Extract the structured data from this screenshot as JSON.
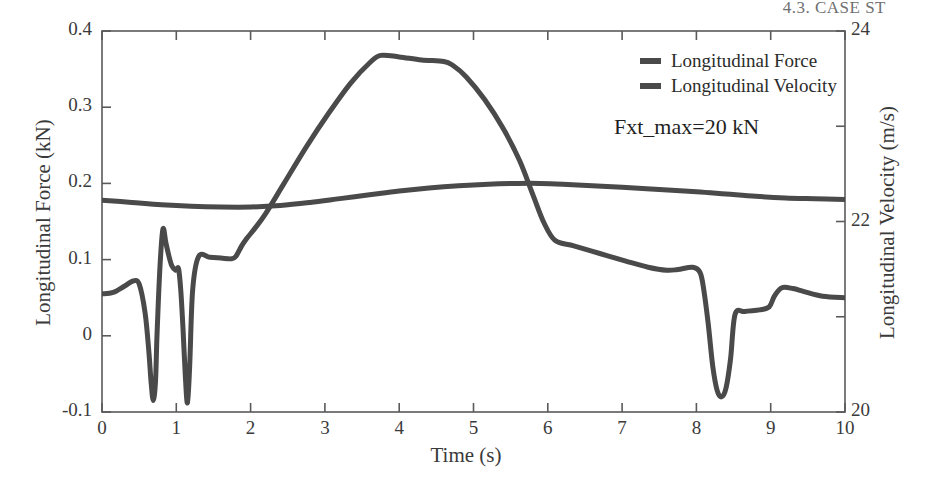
{
  "page": {
    "header": "4.3. CASE ST"
  },
  "chart_data": {
    "type": "line",
    "title": "",
    "xlabel": "Time (s)",
    "ylabel": "Longitudinal Force (kN)",
    "ylabel_right": "Longitudinal Velocity (m/s)",
    "xlim": [
      0,
      10
    ],
    "ylim": [
      -0.1,
      0.4
    ],
    "ylim_right": [
      20,
      24
    ],
    "grid": false,
    "frame": true,
    "legend_position": "top-right-inside",
    "annotations": [
      {
        "text": "Fxt_max=20 kN",
        "x": 6.2,
        "y": 0.245
      }
    ],
    "xticks": [
      0,
      1,
      2,
      3,
      4,
      5,
      6,
      7,
      8,
      9,
      10
    ],
    "xtick_labels": [
      "0",
      "1",
      "2",
      "3",
      "4",
      "5",
      "6",
      "7",
      "8",
      "9",
      "10"
    ],
    "yticks": [
      -0.1,
      0,
      0.1,
      0.2,
      0.3,
      0.4
    ],
    "ytick_labels": [
      "-0.1",
      "0",
      "0.1",
      "0.2",
      "0.3",
      "0.4"
    ],
    "yticks_right": [
      20,
      21,
      22,
      23,
      24
    ],
    "ytick_labels_right": [
      "20",
      "",
      "22",
      "",
      "24"
    ],
    "line_color": "#4a4a4a",
    "line_width": 5,
    "series": [
      {
        "name": "Longitudinal Force",
        "axis": "left",
        "units": "kN",
        "x": [
          0.0,
          0.15,
          0.3,
          0.42,
          0.5,
          0.58,
          0.63,
          0.66,
          0.69,
          0.72,
          0.74,
          0.78,
          0.82,
          0.86,
          0.9,
          0.94,
          0.99,
          1.03,
          1.06,
          1.09,
          1.12,
          1.15,
          1.18,
          1.22,
          1.3,
          1.45,
          1.6,
          1.74,
          1.8,
          1.88,
          1.95,
          2.05,
          2.2,
          2.45,
          2.75,
          3.05,
          3.35,
          3.6,
          3.75,
          4.0,
          4.3,
          4.6,
          4.72,
          4.9,
          5.15,
          5.4,
          5.62,
          5.8,
          5.95,
          6.1,
          6.35,
          6.7,
          7.05,
          7.35,
          7.6,
          7.75,
          7.95,
          8.05,
          8.1,
          8.16,
          8.22,
          8.28,
          8.34,
          8.4,
          8.46,
          8.52,
          8.65,
          8.85,
          8.98,
          9.05,
          9.15,
          9.3,
          9.45,
          9.7,
          10.0
        ],
        "y": [
          0.055,
          0.057,
          0.065,
          0.072,
          0.068,
          0.03,
          -0.02,
          -0.06,
          -0.085,
          -0.06,
          0.0,
          0.09,
          0.14,
          0.122,
          0.105,
          0.092,
          0.086,
          0.088,
          0.06,
          0.01,
          -0.05,
          -0.088,
          -0.04,
          0.06,
          0.104,
          0.103,
          0.102,
          0.101,
          0.104,
          0.118,
          0.128,
          0.14,
          0.16,
          0.2,
          0.248,
          0.292,
          0.332,
          0.358,
          0.368,
          0.366,
          0.362,
          0.36,
          0.355,
          0.34,
          0.31,
          0.272,
          0.23,
          0.185,
          0.148,
          0.125,
          0.118,
          0.108,
          0.098,
          0.09,
          0.086,
          0.087,
          0.09,
          0.083,
          0.06,
          0.015,
          -0.04,
          -0.072,
          -0.08,
          -0.068,
          -0.03,
          0.028,
          0.032,
          0.034,
          0.038,
          0.052,
          0.063,
          0.062,
          0.058,
          0.052,
          0.05
        ]
      },
      {
        "name": "Longitudinal Velocity",
        "axis": "right",
        "units": "m/s",
        "x": [
          0.0,
          0.4,
          0.8,
          1.2,
          1.6,
          2.0,
          2.4,
          2.8,
          3.2,
          3.6,
          4.0,
          4.4,
          4.8,
          5.2,
          5.6,
          5.9,
          6.2,
          6.6,
          7.0,
          7.5,
          8.0,
          8.4,
          8.8,
          9.2,
          9.6,
          10.0
        ],
        "y_left_equiv": [
          0.178,
          0.175,
          0.172,
          0.17,
          0.169,
          0.169,
          0.171,
          0.175,
          0.18,
          0.185,
          0.19,
          0.194,
          0.197,
          0.199,
          0.2,
          0.2,
          0.199,
          0.197,
          0.195,
          0.192,
          0.189,
          0.186,
          0.183,
          0.181,
          0.18,
          0.179
        ],
        "y": [
          22.224,
          22.2,
          22.176,
          22.16,
          22.152,
          22.152,
          22.168,
          22.2,
          22.24,
          22.28,
          22.32,
          22.352,
          22.376,
          22.392,
          22.4,
          22.4,
          22.392,
          22.376,
          22.36,
          22.336,
          22.312,
          22.288,
          22.264,
          22.248,
          22.24,
          22.232
        ]
      }
    ]
  },
  "legend": {
    "items": [
      {
        "label": "Longitudinal Force"
      },
      {
        "label": "Longitudinal Velocity"
      }
    ]
  }
}
